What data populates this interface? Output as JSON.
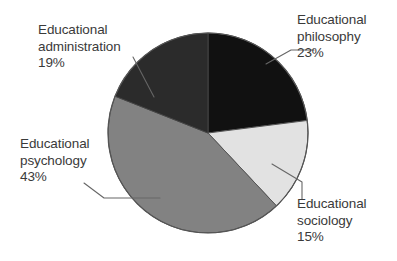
{
  "chart_data": {
    "type": "pie",
    "title": "",
    "subtitle": "",
    "xlabel": "",
    "ylabel": "",
    "legend_position": "none",
    "grid": false,
    "units": "percent",
    "total": 100,
    "start_angle_deg": 0,
    "direction": "clockwise",
    "categories": [
      "Educational philosophy",
      "Educational sociology",
      "Educational psychology",
      "Educational administration"
    ],
    "values": [
      23,
      15,
      43,
      19
    ],
    "slices": [
      {
        "id": "philosophy",
        "label_line1": "Educational",
        "label_line2": "philosophy",
        "label_full": "Educational philosophy",
        "value": 23,
        "value_text": "23%",
        "color": "#111111",
        "start_deg": 0,
        "end_deg": 82.8
      },
      {
        "id": "sociology",
        "label_line1": "Educational",
        "label_line2": "sociology",
        "label_full": "Educational sociology",
        "value": 15,
        "value_text": "15%",
        "color": "#e2e2e2",
        "start_deg": 82.8,
        "end_deg": 136.8
      },
      {
        "id": "psychology",
        "label_line1": "Educational",
        "label_line2": "psychology",
        "label_full": "Educational psychology",
        "value": 43,
        "value_text": "43%",
        "color": "#828282",
        "start_deg": 136.8,
        "end_deg": 291.6
      },
      {
        "id": "administration",
        "label_line1": "Educational",
        "label_line2": "administration",
        "label_full": "Educational administration",
        "value": 19,
        "value_text": "19%",
        "color": "#2b2b2b",
        "start_deg": 291.6,
        "end_deg": 360
      }
    ]
  },
  "colors": {
    "background": "#ffffff",
    "text": "#3a3a3a",
    "outline": "#555555",
    "leader": "#666666",
    "philosophy": "#111111",
    "sociology": "#e2e2e2",
    "psychology": "#828282",
    "administration": "#2b2b2b"
  }
}
